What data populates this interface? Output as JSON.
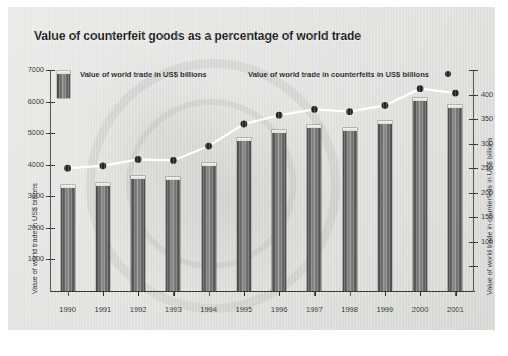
{
  "chart_data": {
    "type": "bar",
    "title": "Value of counterfeit goods as a percentage of world trade",
    "categories": [
      "1990",
      "1991",
      "1992",
      "1993",
      "1994",
      "1995",
      "1996",
      "1997",
      "1998",
      "1999",
      "2000",
      "2001"
    ],
    "series": [
      {
        "name": "Value of world trade in US$ billions",
        "type": "bar",
        "axis": "left",
        "values": [
          3350,
          3420,
          3650,
          3600,
          4050,
          4850,
          5090,
          5270,
          5150,
          5400,
          6100,
          5900
        ]
      },
      {
        "name": "Value of world trade in counterfeits in US$ billions",
        "type": "line",
        "axis": "right",
        "values": [
          250,
          255,
          268,
          266,
          295,
          340,
          358,
          370,
          365,
          378,
          412,
          403
        ]
      }
    ],
    "xlabel": "",
    "ylabel": "Value of world trade in US$ billions",
    "y2label": "Value of world trade in counterfeits in US$ billions",
    "ylim": [
      0,
      7000
    ],
    "y2lim": [
      0,
      450
    ],
    "yticks": [
      1000,
      2000,
      3000,
      4000,
      5000,
      6000,
      7000
    ],
    "ytick_labels": [
      "1000",
      "2000",
      "3000",
      "4000",
      "5000",
      "6000",
      "7000"
    ],
    "y2ticks": [
      50,
      100,
      150,
      200,
      250,
      300,
      350,
      400,
      450
    ],
    "y2tick_labels": [
      "",
      "100",
      "150",
      "200",
      "250",
      "300",
      "350",
      "400",
      ""
    ],
    "grid": false,
    "legend_position": "top"
  },
  "chart": {
    "title": "Value of counterfeit goods as a percentage of world trade",
    "legend": {
      "bars_label": "Value of world trade in US$ billions",
      "line_label": "Value of world trade in counterfeits in US$ billions"
    },
    "axes": {
      "left_title": "Value of world trade in US$ billions",
      "right_title": "Value of world trade in counterfeits in US$ billions"
    }
  },
  "colors": {
    "bar": "#6f6f6f",
    "line": "#ffffff",
    "marker": "#242424",
    "panel_background": "#e4e4e2",
    "text": "#1c1c1c"
  }
}
